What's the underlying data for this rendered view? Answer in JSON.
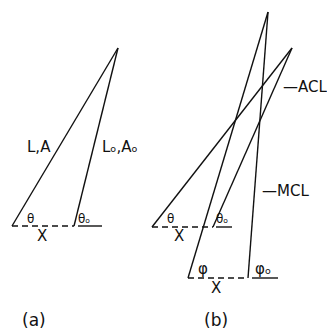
{
  "panel_a": {
    "caption": "(a)",
    "label_current": "L,A",
    "label_original": "Lₒ,Aₒ",
    "angle_current": "θ",
    "angle_original": "θₒ",
    "displacement": "X"
  },
  "panel_b": {
    "caption": "(b)",
    "label_acl": "—ACL",
    "label_mcl": "—MCL",
    "angle_theta": "θ",
    "angle_theta0": "θₒ",
    "angle_phi": "φ",
    "angle_phi0": "φₒ",
    "displacement_upper": "X",
    "displacement_lower": "X"
  },
  "colors": {
    "line": "#111111",
    "background": "#ffffff"
  }
}
